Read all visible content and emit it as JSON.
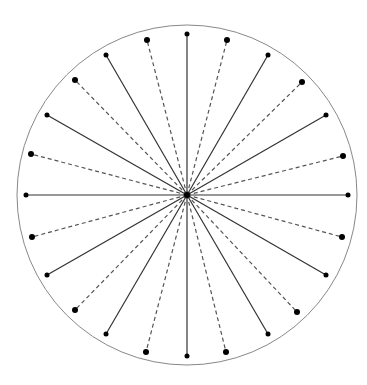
{
  "diagram": {
    "center": [
      187,
      195
    ],
    "circle_radius": 170,
    "colors": {
      "circle": "#888888",
      "solid": "#333333",
      "dashed": "#555555",
      "dot": "#000000"
    },
    "solid_endpoints": [
      [
        187,
        34
      ],
      [
        268,
        55
      ],
      [
        326,
        115
      ],
      [
        348,
        195
      ],
      [
        326,
        275
      ],
      [
        268,
        334
      ],
      [
        187,
        356
      ],
      [
        106,
        334
      ],
      [
        47,
        275
      ],
      [
        26,
        195
      ],
      [
        47,
        115
      ],
      [
        106,
        55
      ]
    ],
    "dashed_endpoints": [
      [
        227,
        40
      ],
      [
        302,
        82
      ],
      [
        343,
        156
      ],
      [
        342,
        237
      ],
      [
        297,
        312
      ],
      [
        226,
        352
      ],
      [
        146,
        352
      ],
      [
        75,
        310
      ],
      [
        32,
        237
      ],
      [
        31,
        154
      ],
      [
        75,
        80
      ],
      [
        147,
        40
      ]
    ]
  }
}
